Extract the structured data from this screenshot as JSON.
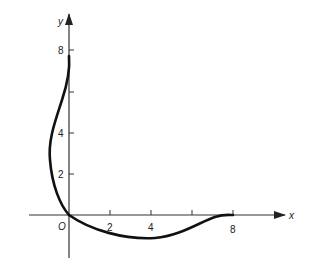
{
  "diagram": {
    "axes": {
      "x_label": "x",
      "y_label": "y",
      "origin_label": "O",
      "x_ticks": [
        {
          "value": 2,
          "label": "2"
        },
        {
          "value": 4,
          "label": "4"
        },
        {
          "value": 6,
          "label": ""
        },
        {
          "value": 8,
          "label": "8"
        }
      ],
      "y_ticks": [
        {
          "value": 2,
          "label": "2"
        },
        {
          "value": 4,
          "label": "4"
        },
        {
          "value": 6,
          "label": ""
        },
        {
          "value": 8,
          "label": "8"
        }
      ]
    },
    "curves": [
      {
        "name": "upper-branch",
        "description": "curve from (0,8) bulging left to about x=-1.4 near y=3, back to origin"
      },
      {
        "name": "lower-branch",
        "description": "curve from origin dipping to about y=-0.6 near x=3, rising to (8,0)"
      }
    ],
    "colors": {
      "ink": "#111111",
      "axis": "#333333"
    }
  }
}
